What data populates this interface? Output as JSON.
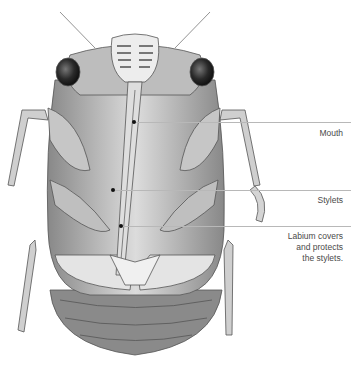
{
  "figure": {
    "labels": [
      {
        "id": "mouth",
        "text": "Mouth",
        "line_y": 122,
        "dot_x": 134,
        "dot_y": 122
      },
      {
        "id": "stylets",
        "text": "Stylets",
        "line_y": 190,
        "dot_x": 113,
        "dot_y": 190
      },
      {
        "id": "labium",
        "text_lines": [
          "Labium covers",
          "and protects",
          "the stylets."
        ],
        "line_y": 226,
        "dot_x": 121,
        "dot_y": 226
      }
    ],
    "colors": {
      "background": "#ffffff",
      "leader": "#b8b8b8",
      "label_text": "#4a4a4a",
      "dot": "#111111"
    }
  }
}
